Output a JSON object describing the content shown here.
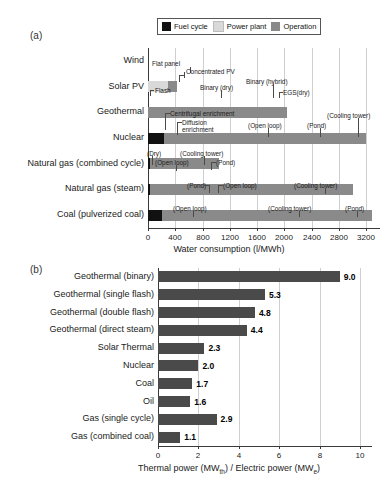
{
  "figure": {
    "panel_a_label": "(a)",
    "panel_b_label": "(b)"
  },
  "legend": {
    "items": [
      {
        "label": "Fuel cycle",
        "color": "#111111"
      },
      {
        "label": "Power plant",
        "color": "#d9d9d9"
      },
      {
        "label": "Operation",
        "color": "#8a8a8a"
      }
    ]
  },
  "chart_data": [
    {
      "type": "bar",
      "orientation": "horizontal",
      "stacked": true,
      "title": "",
      "xlabel": "Water consumption (l/MWh)",
      "ylabel": "",
      "xlim": [
        0,
        3400
      ],
      "xticks": [
        0,
        400,
        800,
        1200,
        1600,
        2000,
        2400,
        2800,
        3200
      ],
      "grid": true,
      "legend_position": "top-right",
      "categories": [
        "Wind",
        "Solar PV",
        "Geothermal",
        "Nuclear",
        "Natural gas (combined cycle)",
        "Natural gas (steam)",
        "Coal (pulverized coal)"
      ],
      "series": [
        {
          "name": "Fuel cycle",
          "values": [
            0,
            0,
            0,
            240,
            30,
            30,
            200
          ]
        },
        {
          "name": "Power plant",
          "values": [
            0,
            290,
            0,
            0,
            0,
            0,
            0
          ]
        },
        {
          "name": "Operation",
          "values": [
            0,
            130,
            2030,
            2960,
            1010,
            2980,
            3080
          ]
        }
      ],
      "annotations": [
        {
          "category": "Solar PV",
          "text": "Flat panel",
          "value": 190
        },
        {
          "category": "Solar PV",
          "text": "Concentrated PV",
          "value": 360
        },
        {
          "category": "Geothermal",
          "text": "Flash",
          "value": 30
        },
        {
          "category": "Geothermal",
          "text": "Binary (dry)",
          "value": 1040
        },
        {
          "category": "Geothermal",
          "text": "Binary (hybrid)",
          "value": 1830
        },
        {
          "category": "Geothermal",
          "text": "EGS(dry)",
          "value": 2030
        },
        {
          "category": "Nuclear",
          "text": "Centrifugal enrichment",
          "value": 120
        },
        {
          "category": "Nuclear",
          "text": "Diffusion enrichment",
          "value": 250
        },
        {
          "category": "Nuclear",
          "text": "(Open loop)",
          "value": 1280
        },
        {
          "category": "Nuclear",
          "text": "(Pond)",
          "value": 2140
        },
        {
          "category": "Nuclear",
          "text": "(Cooling tower)",
          "value": 3000
        },
        {
          "category": "Natural gas (combined cycle)",
          "text": "(Dry)",
          "value": 30
        },
        {
          "category": "Natural gas (combined cycle)",
          "text": "(Open loop)",
          "value": 170
        },
        {
          "category": "Natural gas (combined cycle)",
          "text": "(Cooling tower)",
          "value": 430
        },
        {
          "category": "Natural gas (combined cycle)",
          "text": "(Pond)",
          "value": 1010
        },
        {
          "category": "Natural gas (steam)",
          "text": "(Pond)",
          "value": 860
        },
        {
          "category": "Natural gas (steam)",
          "text": "(Open loop)",
          "value": 1300
        },
        {
          "category": "Natural gas (steam)",
          "text": "(Cooling tower)",
          "value": 2560
        },
        {
          "category": "Coal (pulverized coal)",
          "text": "(Open loop)",
          "value": 760
        },
        {
          "category": "Coal (pulverized coal)",
          "text": "(Cooling tower)",
          "value": 2280
        },
        {
          "category": "Coal (pulverized coal)",
          "text": "(Pond)",
          "value": 3080
        }
      ]
    },
    {
      "type": "bar",
      "orientation": "horizontal",
      "stacked": false,
      "title": "",
      "xlabel_parts": [
        "Thermal power (MW",
        "th",
        ") / Electric power (MW",
        "e",
        ")"
      ],
      "ylabel": "",
      "xlim": [
        0,
        10.6
      ],
      "xticks": [
        0,
        2,
        4,
        6,
        8,
        10
      ],
      "grid": true,
      "bar_color": "#4a4a4a",
      "categories": [
        "Geothermal (binary)",
        "Geothermal (single flash)",
        "Geothermal (double flash)",
        "Geothermal (direct steam)",
        "Solar Thermal",
        "Nuclear",
        "Coal",
        "Oil",
        "Gas (single cycle)",
        "Gas (combined coal)"
      ],
      "values": [
        9.0,
        5.3,
        4.8,
        4.4,
        2.3,
        2.0,
        1.7,
        1.6,
        2.9,
        1.1
      ],
      "value_labels": [
        "9.0",
        "5.3",
        "4.8",
        "4.4",
        "2.3",
        "2.0",
        "1.7",
        "1.6",
        "2.9",
        "1.1"
      ]
    }
  ]
}
